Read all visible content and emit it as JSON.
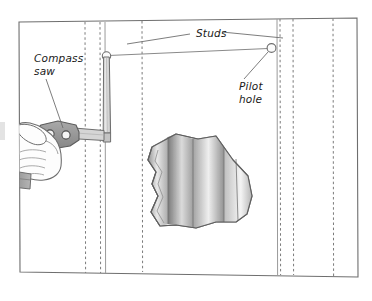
{
  "figure": {
    "kind": "technical-illustration",
    "background_color": "#ffffff",
    "line_color": "#6e6e6e",
    "ink_color": "#1a1a1a"
  },
  "labels": {
    "studs": "Studs",
    "compass_saw_line1": "Compass",
    "compass_saw_line2": "saw",
    "pilot_hole_line1": "Pilot",
    "pilot_hole_line2": "hole"
  },
  "wall": {
    "panel_edge_left_label": "drywall-seam-left",
    "panel_edge_right_label": "drywall-seam-right",
    "stud_line_count": 6
  },
  "colors": {
    "outline": "#6e6e6e",
    "dashed_stud": "#7a7a7a",
    "saw_blade_fill": "#d9d9d9",
    "saw_handle_fill": "#9a9a9a",
    "hand_fill": "#fdfdfd",
    "cuff_fill": "#9e9e9e",
    "cutout_light": "#f2f2f2",
    "cutout_mid": "#c8c8c8",
    "cutout_dark": "#8c8c8c"
  }
}
